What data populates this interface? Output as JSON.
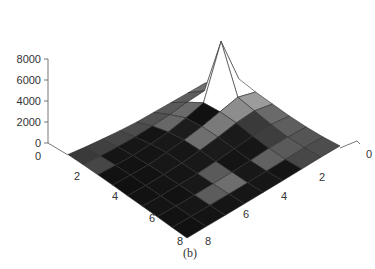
{
  "chart_data": {
    "type": "surface",
    "title": "",
    "caption": "(b)",
    "zlabel": "",
    "xlabel": "",
    "ylabel": "",
    "zlim": [
      0,
      8000
    ],
    "z_ticks": [
      "0",
      "2000",
      "4000",
      "6000",
      "8000"
    ],
    "left_axis_ticks": [
      "0",
      "2",
      "4",
      "6",
      "8"
    ],
    "right_axis_ticks": [
      "0",
      "2",
      "4",
      "6",
      "8"
    ],
    "grid_size": [
      8,
      8
    ],
    "grid": false,
    "colormap": "gray",
    "heights": [
      [
        1800,
        2600,
        3300,
        2600,
        2000,
        1400,
        900,
        500,
        200
      ],
      [
        1500,
        2300,
        7600,
        2900,
        2200,
        1500,
        900,
        500,
        200
      ],
      [
        1200,
        1900,
        2500,
        2300,
        1900,
        1300,
        800,
        400,
        150
      ],
      [
        900,
        1400,
        1800,
        1700,
        1400,
        1000,
        600,
        300,
        100
      ],
      [
        600,
        1000,
        1200,
        1200,
        1000,
        700,
        450,
        200,
        80
      ],
      [
        400,
        650,
        800,
        800,
        650,
        450,
        300,
        150,
        50
      ],
      [
        250,
        400,
        450,
        450,
        400,
        300,
        200,
        100,
        30
      ],
      [
        120,
        200,
        250,
        250,
        200,
        150,
        100,
        50,
        10
      ],
      [
        50,
        80,
        100,
        100,
        80,
        60,
        40,
        20,
        0
      ]
    ],
    "cell_shades": [
      [
        "#6e6e6e",
        "#8a8a8a",
        "#a3a3a3",
        "#9c9c9c",
        "#6a6a6a",
        "#5e5e5e",
        "#555555",
        "#4d4d4d"
      ],
      [
        "#5d5d5d",
        "#7a7a7a",
        "#717171",
        "#8d8d8d",
        "#3a3a3a",
        "#3e3e3e",
        "#5a5a5a",
        "#474747"
      ],
      [
        "#595959",
        "#6a6a6a",
        "#111111",
        "#7a7a7a",
        "#1a1a1a",
        "#161616",
        "#616161",
        "#141414"
      ],
      [
        "#515151",
        "#676767",
        "#1c1c1c",
        "#6f6f6f",
        "#1b1b1b",
        "#141414",
        "#181818",
        "#161616"
      ],
      [
        "#4c4c4c",
        "#141414",
        "#181818",
        "#161616",
        "#181818",
        "#5a5a5a",
        "#6e6e6e",
        "#161616"
      ],
      [
        "#464646",
        "#161616",
        "#141414",
        "#171717",
        "#151515",
        "#181818",
        "#5c5c5c",
        "#151515"
      ],
      [
        "#404040",
        "#151515",
        "#121212",
        "#121212",
        "#141414",
        "#121212",
        "#161616",
        "#141414"
      ],
      [
        "#3a3a3a",
        "#464646",
        "#121212",
        "#101010",
        "#121212",
        "#141414",
        "#121212",
        "#111111"
      ]
    ]
  }
}
